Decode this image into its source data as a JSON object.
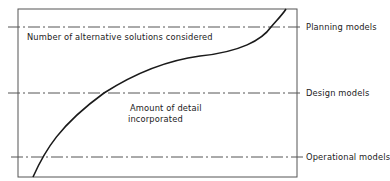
{
  "diagram": {
    "type": "conceptual-curve",
    "levels": [
      {
        "id": "planning",
        "label": "Planning models"
      },
      {
        "id": "design",
        "label": "Design models"
      },
      {
        "id": "operational",
        "label": "Operational models"
      }
    ],
    "annotations": {
      "top": "Number of alternative solutions considered",
      "middle_line1": "Amount of detail",
      "middle_line2": "incorporated"
    },
    "colors": {
      "line": "#222222",
      "background": "#ffffff"
    }
  }
}
